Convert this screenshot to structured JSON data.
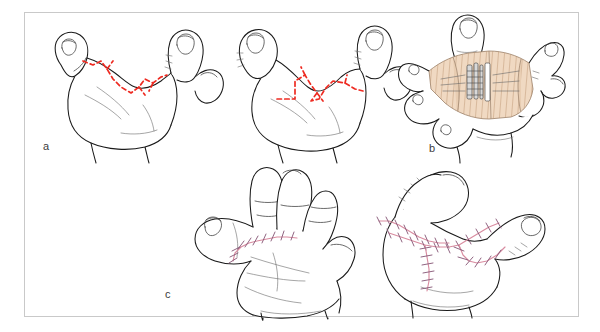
{
  "figure": {
    "kind": "surgical-illustration",
    "background_color": "#ffffff",
    "frame_color": "#c9c9c9",
    "panel_count": 3
  },
  "colors": {
    "outline_ink": "#1a1a1a",
    "incision_marking": "#ee2b22",
    "suture_thread": "#d98ca0",
    "suture_knot": "#8a5c7a",
    "graft_fill": "#f0d9c2",
    "graft_hatch": "#b9926e",
    "deep_tissue": "#d9d9d9",
    "label_text": "#3b3b3b"
  },
  "panels": [
    {
      "id": "a",
      "label": "a",
      "caption": "Planned zigzag (four-flap Z-plasty) incision marked on the contracted first web space, shown on two hand views",
      "marking_style": "red dashed line",
      "views": [
        {
          "name": "dorsoradial-view-left",
          "hand": "left",
          "description": "Thumb and index finger with dashed zigzag incision across the web"
        },
        {
          "name": "dorsoradial-view-right",
          "hand": "left",
          "description": "Opposing view with dashed zigzag incision across the web"
        }
      ]
    },
    {
      "id": "b",
      "label": "b",
      "caption": "Web space opened and deepened; deficit resurfaced with a full-thickness skin graft (hatched area)",
      "marking_style": "hatched beige graft over exposed deep structures",
      "views": [
        {
          "name": "released-web-with-graft",
          "hand": "left",
          "description": "Abducted thumb with graft inlaid into the released web space"
        }
      ]
    },
    {
      "id": "c",
      "label": "c",
      "caption": "Completed closure with interrupted sutures transposing the flaps to widen the web",
      "marking_style": "pink interrupted suture line with cross stitches",
      "views": [
        {
          "name": "palmar-view-sutured",
          "hand": "left",
          "description": "Palmar view showing sutured transverse web closure"
        },
        {
          "name": "radial-view-sutured",
          "hand": "left",
          "description": "Radial view showing branching sutured flap limbs"
        }
      ]
    }
  ]
}
